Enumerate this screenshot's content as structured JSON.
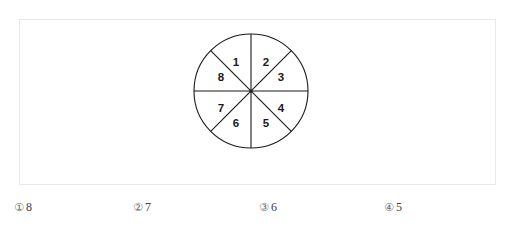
{
  "page": {
    "faded_header_text": "",
    "background_color": "#ffffff",
    "frame_border_color": "#e9e9e9"
  },
  "figure": {
    "name": "circle-divided-into-eight-equal-sectors",
    "shape": "circle",
    "sector_count": 8,
    "stroke_color": "#1a1a1a",
    "fill_color": "#ffffff",
    "center": {
      "x": 59,
      "y": 59
    },
    "radius": 57,
    "diameter_lines": [
      "vertical",
      "horizontal",
      "diagonal-nesw",
      "diagonal-nwse"
    ],
    "sectors": [
      {
        "label": "1",
        "x": 44,
        "y": 30
      },
      {
        "label": "2",
        "x": 74,
        "y": 30
      },
      {
        "label": "3",
        "x": 88,
        "y": 45
      },
      {
        "label": "4",
        "x": 88,
        "y": 76
      },
      {
        "label": "5",
        "x": 74,
        "y": 91
      },
      {
        "label": "6",
        "x": 44,
        "y": 91
      },
      {
        "label": "7",
        "x": 30,
        "y": 76
      },
      {
        "label": "8",
        "x": 30,
        "y": 45
      }
    ]
  },
  "options": [
    {
      "marker": "①",
      "value": "8"
    },
    {
      "marker": "②",
      "value": "7"
    },
    {
      "marker": "③",
      "value": "6"
    },
    {
      "marker": "④",
      "value": "5"
    }
  ]
}
